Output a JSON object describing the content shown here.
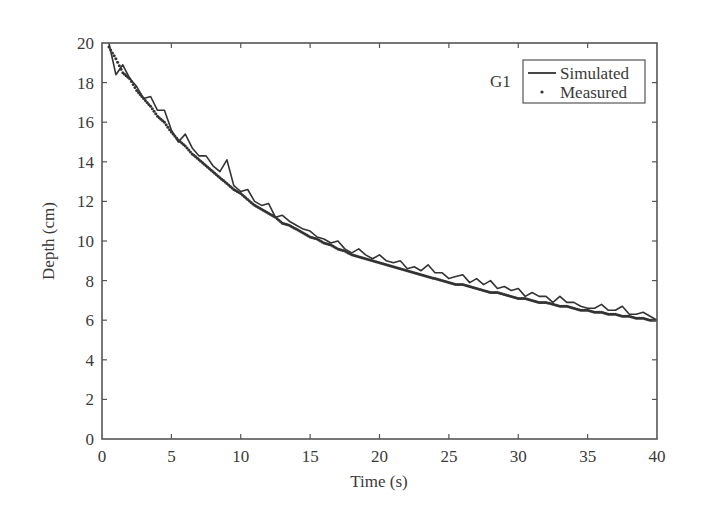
{
  "chart_data": {
    "type": "line",
    "title": "",
    "annotation": "G1",
    "xlabel": "Time (s)",
    "ylabel": "Depth (cm)",
    "xlim": [
      0,
      40
    ],
    "ylim": [
      0,
      20
    ],
    "xticks": [
      0,
      5,
      10,
      15,
      20,
      25,
      30,
      35,
      40
    ],
    "yticks": [
      0,
      2,
      4,
      6,
      8,
      10,
      12,
      14,
      16,
      18,
      20
    ],
    "grid": false,
    "legend_position": "upper right",
    "legend": [
      "Simulated",
      "Measured"
    ],
    "series": [
      {
        "name": "Simulated",
        "style": "solid line",
        "x": [
          0.5,
          1.0,
          1.5,
          2.0,
          2.5,
          3.0,
          3.5,
          4.0,
          4.5,
          5.0,
          5.5,
          6.0,
          6.5,
          7.0,
          7.5,
          8.0,
          8.5,
          9.0,
          9.5,
          10.0,
          10.5,
          11.0,
          11.5,
          12.0,
          12.5,
          13.0,
          13.5,
          14.0,
          14.5,
          15.0,
          15.5,
          16.0,
          16.5,
          17.0,
          17.5,
          18.0,
          18.5,
          19.0,
          19.5,
          20.0,
          20.5,
          21.0,
          21.5,
          22.0,
          22.5,
          23.0,
          23.5,
          24.0,
          24.5,
          25.0,
          25.5,
          26.0,
          26.5,
          27.0,
          27.5,
          28.0,
          28.5,
          29.0,
          29.5,
          30.0,
          30.5,
          31.0,
          31.5,
          32.0,
          32.5,
          33.0,
          33.5,
          34.0,
          34.5,
          35.0,
          35.5,
          36.0,
          36.5,
          37.0,
          37.5,
          38.0,
          38.5,
          39.0,
          39.5,
          40.0
        ],
        "y": [
          20.0,
          18.4,
          18.9,
          18.2,
          17.8,
          17.2,
          17.3,
          16.6,
          16.6,
          15.6,
          15.0,
          15.4,
          14.7,
          14.3,
          14.3,
          13.8,
          13.5,
          14.1,
          12.8,
          12.5,
          12.6,
          12.0,
          11.8,
          11.9,
          11.2,
          11.3,
          11.0,
          10.8,
          10.6,
          10.5,
          10.2,
          10.1,
          9.9,
          10.0,
          9.6,
          9.4,
          9.6,
          9.3,
          9.1,
          9.3,
          9.0,
          8.9,
          9.0,
          8.6,
          8.7,
          8.5,
          8.8,
          8.4,
          8.4,
          8.1,
          8.2,
          8.3,
          7.9,
          8.1,
          7.8,
          8.0,
          7.6,
          7.7,
          7.5,
          7.6,
          7.2,
          7.4,
          7.2,
          7.2,
          6.9,
          7.2,
          6.9,
          6.9,
          6.7,
          6.6,
          6.6,
          6.8,
          6.5,
          6.5,
          6.7,
          6.3,
          6.3,
          6.4,
          6.2,
          6.0
        ]
      },
      {
        "name": "Measured",
        "style": "dots",
        "x": [
          0.5,
          1.0,
          1.5,
          2.0,
          2.5,
          3.0,
          3.5,
          4.0,
          4.5,
          5.0,
          5.5,
          6.0,
          6.5,
          7.0,
          7.5,
          8.0,
          8.5,
          9.0,
          9.5,
          10.0,
          10.5,
          11.0,
          11.5,
          12.0,
          12.5,
          13.0,
          13.5,
          14.0,
          14.5,
          15.0,
          15.5,
          16.0,
          16.5,
          17.0,
          17.5,
          18.0,
          18.5,
          19.0,
          19.5,
          20.0,
          20.5,
          21.0,
          21.5,
          22.0,
          22.5,
          23.0,
          23.5,
          24.0,
          24.5,
          25.0,
          25.5,
          26.0,
          26.5,
          27.0,
          27.5,
          28.0,
          28.5,
          29.0,
          29.5,
          30.0,
          30.5,
          31.0,
          31.5,
          32.0,
          32.5,
          33.0,
          33.5,
          34.0,
          34.5,
          35.0,
          35.5,
          36.0,
          36.5,
          37.0,
          37.5,
          38.0,
          38.5,
          39.0,
          39.5,
          40.0
        ],
        "y": [
          19.8,
          19.2,
          18.5,
          18.2,
          17.6,
          17.2,
          16.8,
          16.3,
          16.0,
          15.5,
          15.1,
          14.8,
          14.4,
          14.1,
          13.8,
          13.5,
          13.2,
          12.9,
          12.6,
          12.4,
          12.1,
          11.8,
          11.6,
          11.4,
          11.2,
          10.9,
          10.8,
          10.6,
          10.4,
          10.2,
          10.1,
          9.9,
          9.8,
          9.6,
          9.5,
          9.3,
          9.2,
          9.1,
          9.0,
          8.9,
          8.8,
          8.7,
          8.6,
          8.5,
          8.4,
          8.3,
          8.2,
          8.1,
          8.0,
          7.9,
          7.8,
          7.8,
          7.7,
          7.6,
          7.5,
          7.4,
          7.4,
          7.3,
          7.2,
          7.1,
          7.1,
          7.0,
          6.9,
          6.9,
          6.8,
          6.7,
          6.7,
          6.6,
          6.5,
          6.5,
          6.4,
          6.4,
          6.3,
          6.3,
          6.2,
          6.2,
          6.1,
          6.1,
          6.0,
          6.0
        ]
      }
    ]
  },
  "colors": {
    "axis": "#555555",
    "simulated": "#333333",
    "measured": "#333333",
    "text": "#3a3a3a"
  }
}
